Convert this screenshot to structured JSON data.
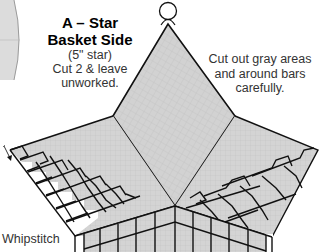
{
  "diagram": {
    "piece_label": "A – Star",
    "piece_name": "Basket Side",
    "size_note": "(5\" star)",
    "cut_instruction_1": "Cut 2 & leave",
    "cut_instruction_2": "unworked.",
    "note_line_1": "Cut out gray areas",
    "note_line_2": "and around bars",
    "note_line_3": "carefully.",
    "whipstitch_label": "Whipstitch",
    "icons": {
      "hanging_loop": "circle-icon",
      "stitch_direction": "arrow-down-icon"
    },
    "colors": {
      "canvas_fill": "#d0d0d0",
      "outline": "#111111",
      "grid": "#b8b8b8",
      "background": "#ffffff"
    }
  }
}
